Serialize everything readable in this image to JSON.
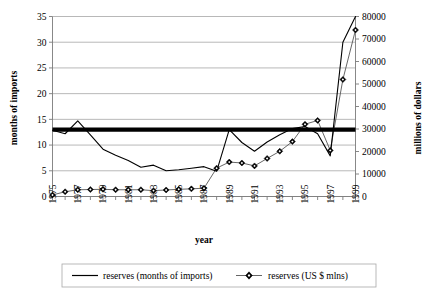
{
  "chart_data": {
    "type": "line",
    "title": "",
    "xlabel": "year",
    "ylabel": "months of imports",
    "y2label": "millions of dollars",
    "grid": true,
    "legend_position": "bottom",
    "x": [
      1975,
      1976,
      1977,
      1978,
      1979,
      1980,
      1981,
      1982,
      1983,
      1984,
      1985,
      1986,
      1987,
      1988,
      1989,
      1990,
      1991,
      1992,
      1993,
      1994,
      1995,
      1996,
      1997,
      1998,
      1999
    ],
    "xtick_labels": [
      "1975",
      "1977",
      "1979",
      "1981",
      "1983",
      "1985",
      "1987",
      "1989",
      "1991",
      "1993",
      "1995",
      "1997",
      "1999"
    ],
    "xtick_values": [
      1975,
      1977,
      1979,
      1981,
      1983,
      1985,
      1987,
      1989,
      1991,
      1993,
      1995,
      1997,
      1999
    ],
    "xlim": [
      1975,
      1999
    ],
    "ylim": [
      0,
      35
    ],
    "ytick_labels": [
      "0",
      "5",
      "10",
      "15",
      "20",
      "25",
      "30",
      "35"
    ],
    "ytick_values": [
      0,
      5,
      10,
      15,
      20,
      25,
      30,
      35
    ],
    "y2lim": [
      0,
      80000
    ],
    "y2tick_labels": [
      "0",
      "10000",
      "20000",
      "30000",
      "40000",
      "50000",
      "60000",
      "70000",
      "80000"
    ],
    "y2tick_values": [
      0,
      10000,
      20000,
      30000,
      40000,
      50000,
      60000,
      70000,
      80000
    ],
    "threshold": {
      "label": "",
      "value_left_axis": 13,
      "value_right_axis": 30000
    },
    "series": [
      {
        "name": "reserves (months of imports)",
        "axis": "left",
        "marker": "none",
        "color": "#000000",
        "values": [
          12.9,
          12.2,
          14.7,
          12.0,
          9.2,
          8.0,
          7.0,
          5.7,
          6.1,
          5.0,
          5.2,
          5.5,
          5.8,
          4.9,
          13.0,
          10.5,
          8.8,
          10.6,
          12.0,
          13.2,
          13.6,
          12.2,
          7.9,
          30.0,
          35.0
        ]
      },
      {
        "name": "reserves (US $ mlns)",
        "axis": "right",
        "marker": "diamond",
        "color": "#555555",
        "values": [
          700,
          2100,
          3000,
          3100,
          3200,
          3000,
          3000,
          3000,
          2600,
          2900,
          3200,
          3400,
          3700,
          12600,
          15300,
          14900,
          13600,
          16900,
          20100,
          24400,
          32100,
          33800,
          20500,
          52000,
          74000
        ]
      }
    ]
  },
  "legend": {
    "entries": [
      {
        "label": "reserves (months of imports)",
        "marker": "none"
      },
      {
        "label": "reserves (US $ mlns)",
        "marker": "diamond"
      }
    ]
  }
}
